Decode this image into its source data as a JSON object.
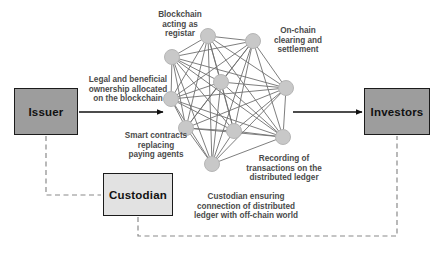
{
  "diagram": {
    "colors": {
      "box_fill_dark": "#9d9d9d",
      "box_fill_light": "#e2e2e2",
      "box_stroke": "#1b1b1b",
      "node_fill": "#c8c8c8",
      "node_stroke": "#b3b3b3",
      "edge_stroke": "#6f6f6f",
      "arrow_stroke": "#111111",
      "dashed_stroke": "#8a8a8a",
      "annotation_text": "#4a4a4a",
      "background": "#ffffff"
    },
    "boxes": [
      {
        "id": "issuer",
        "label": "Issuer",
        "x": 14,
        "y": 88,
        "w": 64,
        "h": 47,
        "fill": "#9d9d9d"
      },
      {
        "id": "investors",
        "label": "Investors",
        "x": 364,
        "y": 88,
        "w": 66,
        "h": 47,
        "fill": "#9d9d9d"
      },
      {
        "id": "custodian",
        "label": "Custodian",
        "x": 103,
        "y": 173,
        "w": 70,
        "h": 43,
        "fill": "#e2e2e2"
      }
    ],
    "annotations": [
      {
        "id": "blockchain-registrar",
        "text": "Blockchain\nacting as\nregistar"
      },
      {
        "id": "onchain-clearing",
        "text": "On-chain\nclearing and\nsettlement"
      },
      {
        "id": "legal-ownership",
        "text": "Legal and beneficial\nownership allocated\non the blockchain"
      },
      {
        "id": "smart-contracts",
        "text": "Smart contracts\nreplacing\npaying agents"
      },
      {
        "id": "recording-tx",
        "text": "Recording of\ntransactions on the\ndistributed ledger"
      },
      {
        "id": "custodian-ensuring",
        "text": "Custodian ensuring\nconnection of distributed\nledger with off-chain world"
      }
    ],
    "network": {
      "description": "Fully-connected mesh of blockchain nodes",
      "node_count": 9,
      "node_radius": 7,
      "nodes": [
        {
          "id": "n0",
          "x": 208,
          "y": 36
        },
        {
          "id": "n1",
          "x": 253,
          "y": 41
        },
        {
          "id": "n2",
          "x": 172,
          "y": 57
        },
        {
          "id": "n3",
          "x": 221,
          "y": 82
        },
        {
          "id": "n4",
          "x": 286,
          "y": 88
        },
        {
          "id": "n5",
          "x": 171,
          "y": 99
        },
        {
          "id": "n6",
          "x": 186,
          "y": 128
        },
        {
          "id": "n7",
          "x": 234,
          "y": 131
        },
        {
          "id": "n8",
          "x": 283,
          "y": 137
        },
        {
          "id": "n9",
          "x": 212,
          "y": 164
        }
      ]
    },
    "connectors": [
      {
        "id": "issuer-to-network",
        "type": "solid-arrow",
        "from": "issuer",
        "to": "network"
      },
      {
        "id": "network-to-investors",
        "type": "solid-arrow",
        "from": "network",
        "to": "investors"
      },
      {
        "id": "issuer-to-custodian",
        "type": "dashed",
        "from": "issuer",
        "to": "custodian"
      },
      {
        "id": "custodian-to-investors",
        "type": "dashed",
        "from": "custodian",
        "to": "investors"
      }
    ]
  }
}
